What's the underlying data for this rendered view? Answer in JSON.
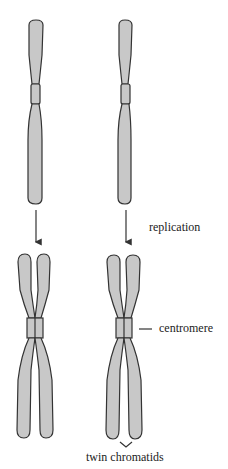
{
  "diagram": {
    "labels": {
      "replication": "replication",
      "centromere": "centromere",
      "twin_chromatids": "twin chromatids"
    },
    "colors": {
      "chromosome_fill": "#c8c8c8",
      "outline": "#333333",
      "background": "#ffffff"
    },
    "stages": [
      {
        "name": "before replication",
        "chromosomes": 2,
        "form": "single chromatid"
      },
      {
        "name": "after replication",
        "chromosomes": 2,
        "form": "twin chromatids joined at centromere"
      }
    ]
  }
}
